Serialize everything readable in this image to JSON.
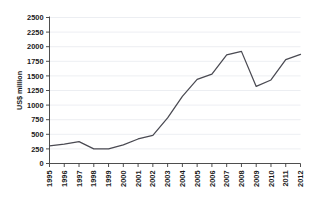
{
  "chart_data": {
    "type": "line",
    "title": "",
    "xlabel": "",
    "ylabel": "US$ million",
    "ylim": [
      0,
      2500
    ],
    "ytick_step": 250,
    "grid": true,
    "legend": "none",
    "line_color": "#4a4a52",
    "categories": [
      "1995",
      "1996",
      "1997",
      "1998",
      "1999",
      "2000",
      "2001",
      "2002",
      "2003",
      "2004",
      "2005",
      "2006",
      "2007",
      "2008",
      "2009",
      "2010",
      "2011",
      "2012"
    ],
    "values": [
      300,
      330,
      375,
      250,
      250,
      320,
      420,
      480,
      780,
      1150,
      1440,
      1530,
      1860,
      1920,
      1320,
      1430,
      1780,
      1870
    ],
    "yticks": [
      "0",
      "250",
      "500",
      "750",
      "1000",
      "1250",
      "1500",
      "1750",
      "2000",
      "2250",
      "2500"
    ],
    "xticks": [
      "1995",
      "1996",
      "1997",
      "1998",
      "1999",
      "2000",
      "2001",
      "2002",
      "2003",
      "2004",
      "2005",
      "2006",
      "2007",
      "2008",
      "2009",
      "2010",
      "2011",
      "2012"
    ]
  }
}
